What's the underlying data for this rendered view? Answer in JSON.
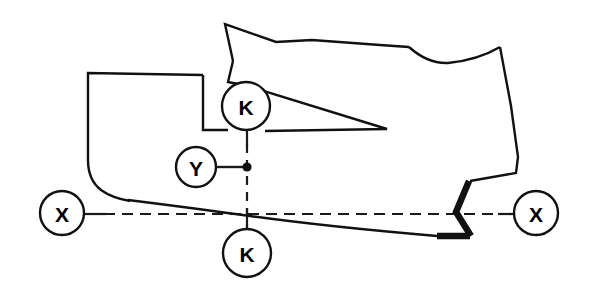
{
  "diagram": {
    "type": "engineering-cross-section",
    "canvas": {
      "width": 592,
      "height": 293
    },
    "colors": {
      "stroke": "#111111",
      "background": "#ffffff",
      "axis": "#1a1a1a"
    },
    "balloons": [
      {
        "id": "balloon-k-upper",
        "label": "K",
        "cx": 246,
        "cy": 106,
        "r": 24
      },
      {
        "id": "balloon-y",
        "label": "Y",
        "cx": 196,
        "cy": 167,
        "r": 20
      },
      {
        "id": "balloon-k-lower",
        "label": "K",
        "cx": 247,
        "cy": 253,
        "r": 24
      },
      {
        "id": "balloon-x-left",
        "label": "X",
        "cx": 62,
        "cy": 213,
        "r": 22
      },
      {
        "id": "balloon-x-right",
        "label": "X",
        "cx": 536,
        "cy": 213,
        "r": 22
      }
    ],
    "axes": {
      "horizontal_label_left": "X",
      "horizontal_label_right": "X",
      "vertical_label_top": "K",
      "vertical_label_bottom": "K",
      "offset_label": "Y",
      "horizontal_y": 214,
      "vertical_x": 247
    },
    "node_point": {
      "cx": 247,
      "cy": 167
    },
    "outline_main": "M 225 24 L 233 60 L 205 74 L 203 75 L 203 130 L 228 130 L 254 130 L 385 128 L 252 88 L 229 83 L 233 60 L 276 43 L 305 40 L 378 45 L 408 47 L 424 60 L 440 62 L 470 55 L 500 48 L 511 104 L 516 155 L 517 172 L 470 180 L 455 212 L 470 236 L 440 236 L 300 228 L 250 219 L 203 210 L 150 200 L 120 196 L 100 188 L 90 170 L 88 120 L 88 72 L 203 74",
    "outline_segments": [
      {
        "name": "top-left-apex",
        "from": [
          225,
          24
        ],
        "to": [
          233,
          60
        ]
      },
      {
        "name": "top-ridge",
        "from": [
          233,
          60
        ],
        "to": [
          500,
          48
        ]
      },
      {
        "name": "upper-right-notch",
        "from": [
          408,
          47
        ],
        "to": [
          500,
          48
        ]
      },
      {
        "name": "right-edge",
        "from": [
          500,
          48
        ],
        "to": [
          517,
          172
        ]
      },
      {
        "name": "right-zigzag-bold",
        "from": [
          470,
          180
        ],
        "to": [
          470,
          236
        ]
      },
      {
        "name": "bottom-bold",
        "from": [
          440,
          236
        ],
        "to": [
          470,
          236
        ]
      },
      {
        "name": "bottom-curve",
        "from": [
          440,
          236
        ],
        "to": [
          100,
          188
        ]
      },
      {
        "name": "left-edge",
        "from": [
          88,
          72
        ],
        "to": [
          88,
          170
        ]
      },
      {
        "name": "step-shelf",
        "from": [
          88,
          74
        ],
        "to": [
          203,
          74
        ]
      },
      {
        "name": "spike-tip",
        "from": [
          252,
          88
        ],
        "to": [
          385,
          128
        ]
      }
    ]
  }
}
